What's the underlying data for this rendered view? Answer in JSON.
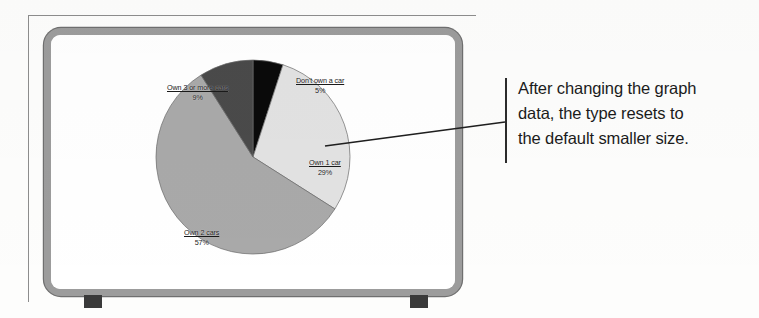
{
  "figure": {
    "device": "crt-monitor-illustration",
    "frame_color": "#9c9c9c",
    "screen_color": "#ffffff",
    "foot_color": "#3a3a3a"
  },
  "chart_data": {
    "type": "pie",
    "title": "",
    "categories": [
      "Don't own a car",
      "Own 1 car",
      "Own 2 cars",
      "Own 3 or more cars"
    ],
    "values": [
      5,
      29,
      57,
      9
    ],
    "value_labels": [
      "5%",
      "29%",
      "57%",
      "9%"
    ],
    "colors": [
      "#0a0a0a",
      "#e2e2e2",
      "#a9a9a9",
      "#4a4a4a"
    ],
    "start_angle_deg": 0,
    "direction": "clockwise",
    "legend": "none",
    "labels_position": "outside-and-inside",
    "units": "percent",
    "slices": [
      {
        "label": "Don't own a car",
        "value": 5,
        "value_label": "5%",
        "color": "#0a0a0a"
      },
      {
        "label": "Own 1 car",
        "value": 29,
        "value_label": "29%",
        "color": "#e2e2e2"
      },
      {
        "label": "Own 2 cars",
        "value": 57,
        "value_label": "57%",
        "color": "#a9a9a9"
      },
      {
        "label": "Own 3 or more cars",
        "value": 9,
        "value_label": "9%",
        "color": "#4a4a4a"
      }
    ]
  },
  "callout": {
    "lines": [
      "After changing the graph",
      "data, the type resets to",
      "the default smaller size."
    ],
    "bar_color": "#2b2b2b",
    "leader_target": "Own 1 car label"
  }
}
